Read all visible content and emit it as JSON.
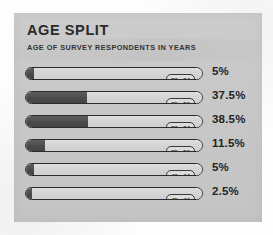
{
  "panel": {
    "title": "AGE SPLIT",
    "subtitle": "AGE OF SURVEY RESPONDENTS IN YEARS",
    "background_color": "#c9c9c9",
    "bar_fill_color": "#4a4a4a",
    "bar_track_color": "#d8d8d8",
    "outline_color": "#2b2b2b",
    "text_color": "#232323"
  },
  "chart_data": {
    "type": "bar",
    "orientation": "horizontal",
    "title": "AGE SPLIT",
    "subtitle": "AGE OF SURVEY RESPONDENTS IN YEARS",
    "xlabel": "",
    "ylabel": "",
    "xlim": [
      0,
      100
    ],
    "grid": false,
    "legend": false,
    "unit": "%",
    "categories": [
      "20 - 24",
      "25 - 29",
      "30 - 34",
      "35 - 39",
      "40 - 44",
      "45 - 49"
    ],
    "values": [
      5,
      37.5,
      38.5,
      11.5,
      5,
      2.5
    ],
    "value_labels": [
      "5%",
      "37.5%",
      "38.5%",
      "11.5%",
      "5%",
      "2.5%"
    ],
    "bars": [
      {
        "range": "20 - 24",
        "value": 5,
        "label": "5%",
        "fill_pct": 5
      },
      {
        "range": "25 - 29",
        "value": 37.5,
        "label": "37.5%",
        "fill_pct": 37.5
      },
      {
        "range": "30 - 34",
        "value": 38.5,
        "label": "38.5%",
        "fill_pct": 38.5
      },
      {
        "range": "35 - 39",
        "value": 11.5,
        "label": "11.5%",
        "fill_pct": 11.5
      },
      {
        "range": "40 - 44",
        "value": 5,
        "label": "5%",
        "fill_pct": 5
      },
      {
        "range": "45 - 49",
        "value": 2.5,
        "label": "2.5%",
        "fill_pct": 2.5
      }
    ]
  }
}
